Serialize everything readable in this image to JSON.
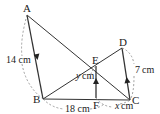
{
  "diagram": {
    "type": "geometry",
    "points": {
      "A": {
        "label": "A",
        "x": 27,
        "y": 15
      },
      "B": {
        "label": "B",
        "x": 43,
        "y": 99
      },
      "C": {
        "label": "C",
        "x": 130,
        "y": 100
      },
      "D": {
        "label": "D",
        "x": 122,
        "y": 48
      },
      "E": {
        "label": "E",
        "x": 96,
        "y": 66
      },
      "F": {
        "label": "F",
        "x": 96,
        "y": 98
      }
    },
    "segments": [
      "AB",
      "AC",
      "BD",
      "BC",
      "DC",
      "EF"
    ],
    "measurements": {
      "AB": {
        "var": "",
        "value": "14",
        "unit": "cm",
        "text": "14 cm"
      },
      "BC": {
        "var": "",
        "value": "18",
        "unit": "cm",
        "text": "18 cm"
      },
      "DC": {
        "var": "",
        "value": "7",
        "unit": "cm",
        "text": "7 cm"
      },
      "EF": {
        "var": "y",
        "unit": "cm",
        "text": "cm"
      },
      "FC": {
        "var": "x",
        "unit": "cm",
        "text": "cm"
      }
    },
    "colors": {
      "line": "#333333",
      "dash": "#888888"
    }
  }
}
